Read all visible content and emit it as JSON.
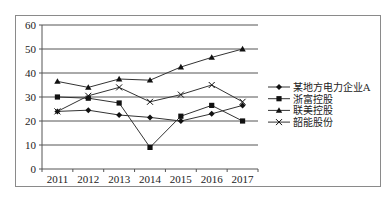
{
  "chart_data": {
    "type": "line",
    "title": "",
    "xlabel": "",
    "ylabel": "",
    "categories": [
      "2011",
      "2012",
      "2013",
      "2014",
      "2015",
      "2016",
      "2017"
    ],
    "yticks": [
      0,
      10,
      20,
      30,
      40,
      50,
      60
    ],
    "ylim": [
      0,
      60
    ],
    "grid": true,
    "legend_position": "right",
    "series": [
      {
        "name": "某地方电力企业A",
        "marker": "diamond",
        "values": [
          24,
          24.5,
          22.5,
          21.5,
          20,
          23,
          26.5
        ]
      },
      {
        "name": "浙富控股",
        "marker": "square",
        "values": [
          30,
          29.5,
          27.5,
          9,
          22,
          26.5,
          20
        ]
      },
      {
        "name": "联美控股",
        "marker": "triangle",
        "values": [
          36.5,
          34,
          37.5,
          37,
          42.5,
          46.5,
          50
        ]
      },
      {
        "name": "韶能股份",
        "marker": "x",
        "values": [
          24,
          30.5,
          34,
          28,
          31,
          35,
          28
        ]
      }
    ]
  },
  "colors": {
    "line": "#333333",
    "grid": "#555555",
    "frame": "#8a8a8a"
  }
}
